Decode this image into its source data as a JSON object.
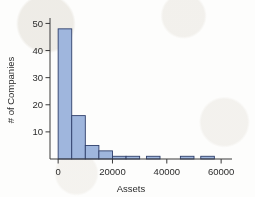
{
  "chart_data": {
    "type": "bar",
    "title": "",
    "subtitle": "",
    "xlabel": "Assets",
    "ylabel": "# of Companies",
    "xlim": [
      -3000,
      64000
    ],
    "ylim": [
      0,
      52
    ],
    "grid": false,
    "legend": null,
    "bin_width": 5000,
    "x_ticks": [
      0,
      20000,
      40000,
      60000
    ],
    "x_tick_labels": [
      "0",
      "20000",
      "40000",
      "60000"
    ],
    "y_ticks": [
      10,
      20,
      30,
      40,
      50
    ],
    "y_tick_labels": [
      "10",
      "20",
      "30",
      "40",
      "50"
    ],
    "bins": [
      {
        "x0": 0,
        "x1": 5000,
        "count": 48
      },
      {
        "x0": 5000,
        "x1": 10000,
        "count": 16
      },
      {
        "x0": 10000,
        "x1": 15000,
        "count": 5
      },
      {
        "x0": 15000,
        "x1": 20000,
        "count": 3
      },
      {
        "x0": 20000,
        "x1": 25000,
        "count": 1
      },
      {
        "x0": 25000,
        "x1": 30000,
        "count": 1
      },
      {
        "x0": 30000,
        "x1": 35000,
        "count": 0
      },
      {
        "x0": 32500,
        "x1": 37500,
        "count": 1
      },
      {
        "x0": 45000,
        "x1": 50000,
        "count": 1
      },
      {
        "x0": 52500,
        "x1": 57500,
        "count": 1
      }
    ],
    "categories": [
      "0-5000",
      "5000-10000",
      "10000-15000",
      "15000-20000",
      "20000-25000",
      "25000-30000",
      "32500-37500",
      "45000-50000",
      "52500-57500"
    ],
    "values": [
      48,
      16,
      5,
      3,
      1,
      1,
      1,
      1,
      1
    ],
    "colors": {
      "bar_fill": "#9fb6dd",
      "bar_stroke": "#2f3f6b",
      "axis": "#3a3a3a",
      "text": "#2b2b2b",
      "background": "#fdfdfc"
    }
  }
}
